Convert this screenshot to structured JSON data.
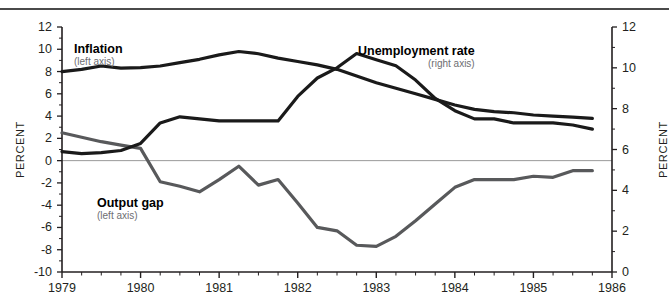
{
  "chart_data": {
    "type": "line",
    "title": "",
    "xlabel": "",
    "ylabel": "PERCENT",
    "y2label": "PERCENT",
    "xlim": [
      1979,
      1986
    ],
    "ylim": [
      -10,
      12
    ],
    "y2lim": [
      0,
      12
    ],
    "grid": false,
    "zero_line": true,
    "legend_position": "inline-annotations",
    "x_ticks": [
      "1979",
      "1980",
      "1981",
      "1982",
      "1983",
      "1984",
      "1985",
      "1986"
    ],
    "y_ticks_left": [
      "12",
      "10",
      "8",
      "6",
      "4",
      "2",
      "0",
      "-2",
      "-4",
      "-6",
      "-8",
      "-10"
    ],
    "y_ticks_right": [
      "12",
      "10",
      "8",
      "6",
      "4",
      "2",
      "0"
    ],
    "x": [
      1979.0,
      1979.25,
      1979.5,
      1979.75,
      1980.0,
      1980.25,
      1980.5,
      1980.75,
      1981.0,
      1981.25,
      1981.5,
      1981.75,
      1982.0,
      1982.25,
      1982.5,
      1982.75,
      1983.0,
      1983.25,
      1983.5,
      1983.75,
      1984.0,
      1984.25,
      1984.5,
      1984.75,
      1985.0,
      1985.25,
      1985.5,
      1985.75
    ],
    "series": [
      {
        "name": "Inflation",
        "axis": "left",
        "axis_note": "(left axis)",
        "color": "#1a1a1a",
        "width": 3.2,
        "values": [
          8.0,
          8.2,
          8.5,
          8.3,
          8.35,
          8.5,
          8.8,
          9.1,
          9.5,
          9.8,
          9.6,
          9.2,
          8.9,
          8.6,
          8.2,
          7.6,
          7.0,
          6.5,
          6.0,
          5.5,
          5.0,
          4.6,
          4.4,
          4.3,
          4.1,
          4.0,
          3.9,
          3.8
        ]
      },
      {
        "name": "Unemployment rate",
        "axis": "right",
        "axis_note": "(right axis)",
        "color": "#1a1a1a",
        "width": 3.2,
        "values": [
          5.9,
          5.8,
          5.85,
          5.95,
          6.3,
          7.3,
          7.6,
          7.5,
          7.4,
          7.4,
          7.4,
          7.4,
          8.6,
          9.5,
          10.0,
          10.7,
          10.4,
          10.1,
          9.4,
          8.5,
          7.9,
          7.5,
          7.5,
          7.3,
          7.3,
          7.3,
          7.2,
          7.0
        ]
      },
      {
        "name": "Output gap",
        "axis": "left",
        "axis_note": "(left axis)",
        "color": "#58595b",
        "width": 3.2,
        "values": [
          2.5,
          2.1,
          1.7,
          1.4,
          1.1,
          -1.9,
          -2.3,
          -2.8,
          -1.7,
          -0.5,
          -2.2,
          -1.7,
          -3.8,
          -6.0,
          -6.3,
          -7.6,
          -7.7,
          -6.8,
          -5.4,
          -3.9,
          -2.4,
          -1.7,
          -1.7,
          -1.7,
          -1.4,
          -1.5,
          -0.9,
          -0.9
        ]
      }
    ]
  },
  "labels": {
    "inflation_name": "Inflation",
    "inflation_axis_note": "(left axis)",
    "unemployment_name": "Unemployment rate",
    "unemployment_axis_note": "(right axis)",
    "outputgap_name": "Output gap",
    "outputgap_axis_note": "(left axis)",
    "percent_left": "PERCENT",
    "percent_right": "PERCENT"
  },
  "colors": {
    "dark_line": "#1a1a1a",
    "gray_line": "#58595b",
    "axis": "#231f20",
    "zero_line": "#9a9a9a",
    "rule": "#4a4a4a",
    "background": "#ffffff"
  }
}
